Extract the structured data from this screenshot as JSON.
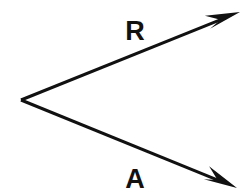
{
  "figure": {
    "title": "",
    "background_color": "#ffffff",
    "stroke_color": "#111111",
    "width": 251,
    "height": 196
  },
  "chart_data": {
    "type": "diagram",
    "subtype": "vector-angle-diagram",
    "title": "",
    "xlabel": "",
    "ylabel": "",
    "grid": false,
    "legend": null,
    "origin": {
      "label": "vertex",
      "x": 21,
      "y": 100
    },
    "vectors": [
      {
        "name": "R",
        "label": "R",
        "start_x": 21,
        "start_y": 100,
        "end_x": 240,
        "end_y": 12,
        "direction": "upper-right",
        "has_arrowhead": true,
        "stroke_width": 3,
        "color": "#111111",
        "label_x": 135,
        "label_y": 40
      },
      {
        "name": "A",
        "label": "A",
        "start_x": 21,
        "start_y": 100,
        "end_x": 237,
        "end_y": 188,
        "direction": "lower-right",
        "has_arrowhead": true,
        "stroke_width": 3,
        "color": "#111111",
        "label_x": 135,
        "label_y": 188
      }
    ]
  },
  "labels": {
    "upper_vector": "R",
    "lower_vector": "A"
  }
}
